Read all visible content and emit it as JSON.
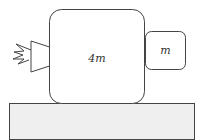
{
  "diagram": {
    "large_block": {
      "label": "4m"
    },
    "small_block": {
      "label": "m"
    },
    "thruster": {
      "icon": "rocket-thruster-flame"
    },
    "surface": {
      "fill": "#efefef"
    },
    "colors": {
      "stroke": "#444444",
      "surface_fill": "#efefef",
      "background": "#ffffff"
    }
  }
}
